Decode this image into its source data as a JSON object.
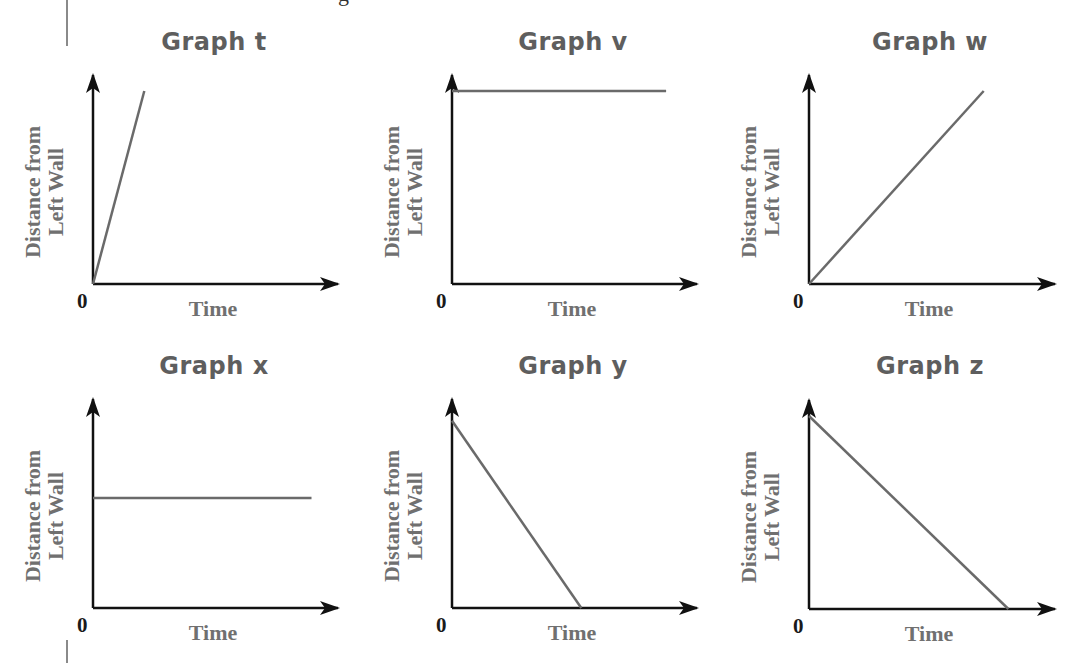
{
  "chart_data": [
    {
      "id": "t",
      "type": "line",
      "title": "Graph t",
      "xlabel": "Time",
      "ylabel": [
        "Distance from",
        "Left Wall"
      ],
      "origin_label": "0",
      "description": "steep increasing straight line from origin",
      "x": [
        0,
        0.23
      ],
      "y": [
        0,
        1.0
      ],
      "xlim": [
        0,
        1
      ],
      "ylim": [
        0,
        1.1
      ],
      "grid": false
    },
    {
      "id": "v",
      "type": "line",
      "title": "Graph v",
      "xlabel": "Time",
      "ylabel": [
        "Distance from",
        "Left Wall"
      ],
      "origin_label": "0",
      "description": "horizontal line at high constant distance",
      "x": [
        0,
        0.96
      ],
      "y": [
        1.0,
        1.0
      ],
      "xlim": [
        0,
        1
      ],
      "ylim": [
        0,
        1.1
      ],
      "grid": false
    },
    {
      "id": "w",
      "type": "line",
      "title": "Graph w",
      "xlabel": "Time",
      "ylabel": [
        "Distance from",
        "Left Wall"
      ],
      "origin_label": "0",
      "description": "moderate increasing straight line from origin",
      "x": [
        0,
        0.78
      ],
      "y": [
        0,
        1.0
      ],
      "xlim": [
        0,
        1
      ],
      "ylim": [
        0,
        1.1
      ],
      "grid": false
    },
    {
      "id": "x",
      "type": "line",
      "title": "Graph x",
      "xlabel": "Time",
      "ylabel": [
        "Distance from",
        "Left Wall"
      ],
      "origin_label": "0",
      "description": "horizontal line at medium constant distance",
      "x": [
        0,
        0.98
      ],
      "y": [
        0.57,
        0.57
      ],
      "xlim": [
        0,
        1
      ],
      "ylim": [
        0,
        1.1
      ],
      "grid": false
    },
    {
      "id": "y",
      "type": "line",
      "title": "Graph y",
      "xlabel": "Time",
      "ylabel": [
        "Distance from",
        "Left Wall"
      ],
      "origin_label": "0",
      "description": "steeper decreasing line reaching zero distance",
      "x": [
        0,
        0.58
      ],
      "y": [
        0.97,
        0
      ],
      "xlim": [
        0,
        1
      ],
      "ylim": [
        0,
        1.1
      ],
      "grid": false
    },
    {
      "id": "z",
      "type": "line",
      "title": "Graph z",
      "xlabel": "Time",
      "ylabel": [
        "Distance from",
        "Left Wall"
      ],
      "origin_label": "0",
      "description": "gentler decreasing line reaching zero distance",
      "x": [
        0,
        0.89
      ],
      "y": [
        1.0,
        0
      ],
      "xlim": [
        0,
        1
      ],
      "ylim": [
        0,
        1.1
      ],
      "grid": false
    }
  ],
  "colors": {
    "axis": "#111111",
    "data_line": "#6a6a6a",
    "title": "#5e5e5e",
    "label": "#707070"
  },
  "clipped_header_glyph": "g"
}
